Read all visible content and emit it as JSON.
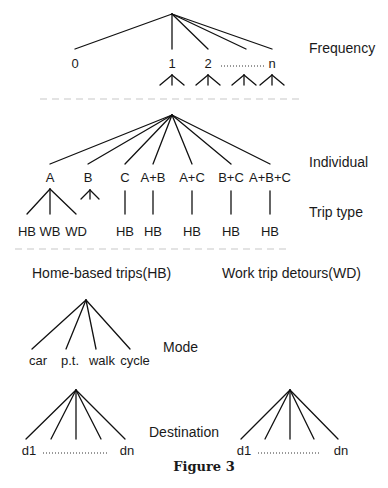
{
  "figure": {
    "caption": "Figure 3",
    "colors": {
      "line": "#111111",
      "text": "#1a1a1a",
      "separator": "#c8c8c8",
      "background": "#ffffff"
    }
  },
  "levels": {
    "frequency": "Frequency",
    "individual": "Individual",
    "trip_type": "Trip type",
    "mode": "Mode",
    "destination": "Destination"
  },
  "frequency": {
    "root": [
      172,
      14
    ],
    "nodes": [
      {
        "label": "0",
        "x": 75
      },
      {
        "label": "1",
        "x": 172
      },
      {
        "label": "2",
        "x": 208
      },
      {
        "label": "",
        "x": 246
      },
      {
        "label": "n",
        "x": 272
      }
    ],
    "branch_y": 49,
    "label_y": 68,
    "ellipsis": {
      "x1": 221,
      "x2": 265,
      "y": 66
    },
    "sub_carets_x": [
      172,
      208,
      244,
      272
    ]
  },
  "individual": {
    "root": [
      172,
      115
    ],
    "branch_y": 164,
    "label_y": 182,
    "nodes": [
      {
        "label": "A",
        "x": 50
      },
      {
        "label": "B",
        "x": 88
      },
      {
        "label": "C",
        "x": 125
      },
      {
        "label": "A+B",
        "x": 153
      },
      {
        "label": "A+C",
        "x": 192
      },
      {
        "label": "B+C",
        "x": 231
      },
      {
        "label": "A+B+C",
        "x": 270
      }
    ]
  },
  "trip_type": {
    "label_y": 236,
    "top_y": 189,
    "bottom_y": 214,
    "a_children": [
      {
        "label": "HB",
        "x": 27
      },
      {
        "label": "WB",
        "x": 50
      },
      {
        "label": "WD",
        "x": 76
      }
    ],
    "b_caret_x": 90,
    "single_children": [
      {
        "label": "HB",
        "x": 125
      },
      {
        "label": "HB",
        "x": 153
      },
      {
        "label": "HB",
        "x": 192
      },
      {
        "label": "HB",
        "x": 231
      },
      {
        "label": "HB",
        "x": 270
      }
    ]
  },
  "sections": {
    "home_based": "Home-based trips(HB)",
    "work_detours": "Work trip detours(WD)"
  },
  "mode": {
    "root": [
      86,
      300
    ],
    "branch_y": 349,
    "label_y": 365,
    "nodes": [
      {
        "label": "car",
        "x": 32,
        "lx": 38
      },
      {
        "label": "p.t.",
        "x": 66,
        "lx": 70
      },
      {
        "label": "walk",
        "x": 96,
        "lx": 102
      },
      {
        "label": "cycle",
        "x": 130,
        "lx": 135
      }
    ]
  },
  "destination": {
    "trees": [
      {
        "root": [
          76,
          390
        ],
        "xs": [
          26,
          51,
          76,
          101,
          125
        ],
        "first": "d1",
        "last": "dn",
        "first_x": 29,
        "last_x": 127,
        "dots": [
          43,
          107
        ]
      },
      {
        "root": [
          290,
          390
        ],
        "xs": [
          241,
          265,
          290,
          314,
          338
        ],
        "first": "d1",
        "last": "dn",
        "first_x": 244,
        "last_x": 341,
        "dots": [
          258,
          321
        ]
      }
    ],
    "branch_y": 439,
    "label_y": 455
  }
}
